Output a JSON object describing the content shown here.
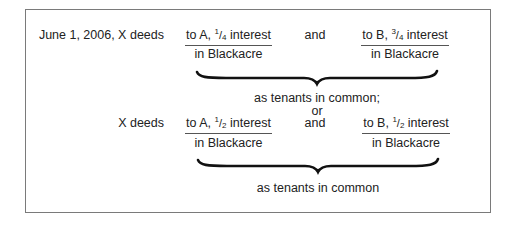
{
  "diagram": {
    "first_conveyance": {
      "lead": "June 1, 2006, X deeds",
      "grant_a": {
        "prefix": "to A, ",
        "num": "1",
        "den": "4",
        "suffix": " interest",
        "property": "in Blackacre"
      },
      "connector": "and",
      "grant_b": {
        "prefix": "to B, ",
        "num": "3",
        "den": "4",
        "suffix": " interest",
        "property": "in Blackacre"
      },
      "result": "as tenants in common;"
    },
    "separator": "or",
    "second_conveyance": {
      "lead": "X deeds",
      "grant_a": {
        "prefix": "to A, ",
        "num": "1",
        "den": "2",
        "suffix": " interest",
        "property": "in Blackacre"
      },
      "connector": "and",
      "grant_b": {
        "prefix": "to B, ",
        "num": "1",
        "den": "2",
        "suffix": " interest",
        "property": "in Blackacre"
      },
      "result": "as tenants in common"
    },
    "slash": "/"
  }
}
